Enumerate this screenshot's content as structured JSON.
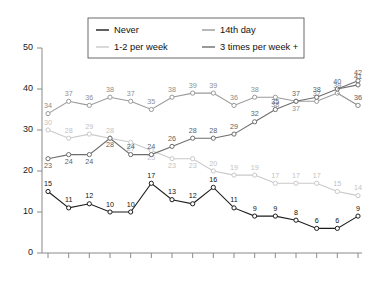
{
  "chart_data": {
    "type": "line",
    "title": "",
    "subtitle": "",
    "xlabel": "",
    "ylabel": "",
    "ylim": [
      0,
      50
    ],
    "yticks": [
      0,
      10,
      20,
      30,
      40,
      50
    ],
    "grid": false,
    "legend_position": "top-center",
    "legend_layout": "2x2",
    "marker": "open-circle",
    "point_labels": true,
    "categories": [
      "1985",
      "1987",
      "1989",
      "1991",
      "1993",
      "1995",
      "1997",
      "1999",
      "2001",
      "2003",
      "2005",
      "2007",
      "2009",
      "2011",
      "2013",
      "2015"
    ],
    "series": [
      {
        "name": "Never",
        "color": "#1c1c1c",
        "label_color": "#111111",
        "values": [
          15,
          11,
          12,
          10,
          10,
          17,
          13,
          12,
          16,
          11,
          9,
          9,
          8,
          6,
          6,
          9
        ]
      },
      {
        "name": "14th day",
        "color": "#9a9a9a",
        "label_color": "#8d8d8d",
        "values": [
          34,
          37,
          36,
          38,
          37,
          35,
          38,
          39,
          39,
          36,
          38,
          38,
          37,
          37,
          39,
          36
        ]
      },
      {
        "name": "1-2 per week",
        "color": "#c9c9c9",
        "label_color": "#c2c2c2",
        "values": [
          30,
          28,
          29,
          28,
          27,
          25,
          23,
          23,
          20,
          19,
          19,
          17,
          17,
          17,
          15,
          14
        ]
      },
      {
        "name": "3 times per week +",
        "color": "#6e6e6e",
        "label_color": "#5f5f5f",
        "values": [
          23,
          24,
          24,
          28,
          24,
          24,
          26,
          28,
          28,
          29,
          32,
          35,
          37,
          38,
          40,
          42
        ]
      }
    ],
    "extra_points": [
      {
        "series": "14th day",
        "x": "2015",
        "value": 36
      },
      {
        "series": "3 times per week +",
        "x": "2015",
        "value": 41
      }
    ],
    "axis_color": "#8a8a8a"
  },
  "legend": {
    "entries": [
      {
        "label": "Never",
        "color": "#1c1c1c"
      },
      {
        "label": "14th day",
        "color": "#9a9a9a"
      },
      {
        "label": "1-2 per week",
        "color": "#c9c9c9"
      },
      {
        "label": "3 times per week +",
        "color": "#6e6e6e"
      }
    ]
  }
}
